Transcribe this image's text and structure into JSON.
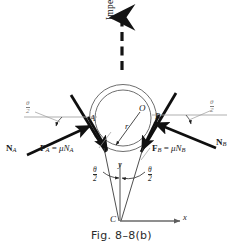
{
  "figure": {
    "caption": "Fig. 8–8(b)",
    "motion_label": "Impending motion",
    "points": {
      "center": "O",
      "radius": "r",
      "contact_left": "A",
      "contact_right": "B",
      "vertex": "C"
    },
    "axes": {
      "x_label": "x",
      "y_label": "y"
    },
    "forces": {
      "normal_left_vector": "N",
      "normal_left_sub": "A",
      "normal_right_vector": "N",
      "normal_right_sub": "B",
      "friction_left_vector": "F",
      "friction_left_sub": "A",
      "friction_left_equals": "=",
      "friction_left_mu": "μN",
      "friction_left_mu_sub": "A",
      "friction_right_vector": "F",
      "friction_right_sub": "B",
      "friction_right_equals": "=",
      "friction_right_mu": "μN",
      "friction_right_mu_sub": "B"
    },
    "angles": {
      "theta": "θ",
      "half": "2",
      "label_top_left": "θ/2",
      "label_top_right": "θ/2",
      "label_bottom_left": "θ/2",
      "label_bottom_right": "θ/2"
    },
    "colors": {
      "ink": "#141414",
      "thin_line": "#4a4a4a",
      "faint_line": "#9a9a9a",
      "background": "#ffffff"
    }
  }
}
